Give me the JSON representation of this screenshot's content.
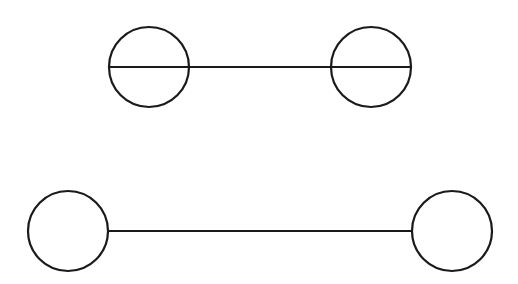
{
  "diagram": {
    "stroke_color": "#1a1a1a",
    "background": "#ffffff",
    "stroke_width": 2.2,
    "top_pair": {
      "description": "two circles with horizontal diameter line passing through both",
      "left_circle": {
        "cx": 149,
        "cy": 67,
        "r": 40
      },
      "right_circle": {
        "cx": 371,
        "cy": 67,
        "r": 40
      },
      "line": {
        "x1": 109,
        "y1": 67,
        "x2": 411,
        "y2": 67
      }
    },
    "bottom_pair": {
      "description": "two circles connected by a line between their edges",
      "left_circle": {
        "cx": 68,
        "cy": 231,
        "r": 40
      },
      "right_circle": {
        "cx": 452,
        "cy": 231,
        "r": 40
      },
      "line": {
        "x1": 108,
        "y1": 231,
        "x2": 412,
        "y2": 231
      }
    }
  }
}
